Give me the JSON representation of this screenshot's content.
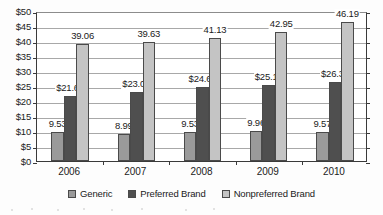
{
  "chart_data": {
    "type": "bar",
    "title": "",
    "xlabel": "",
    "ylabel": "",
    "categories": [
      "2006",
      "2007",
      "2008",
      "2009",
      "2010"
    ],
    "series": [
      {
        "name": "Generic",
        "color": "#9a9a9a",
        "values": [
          9.53,
          8.99,
          9.53,
          9.96,
          9.57
        ],
        "labels": [
          "9.53",
          "8.99",
          "9.53",
          "9.96",
          "9.57"
        ]
      },
      {
        "name": "Preferred Brand",
        "color": "#4f4f4f",
        "values": [
          21.61,
          23.08,
          24.62,
          25.19,
          26.31
        ],
        "labels": [
          "$21.61",
          "$23.08",
          "$24.62",
          "$25.19",
          "$26.31"
        ]
      },
      {
        "name": "Nonpreferred Brand",
        "color": "#c4c4c4",
        "values": [
          39.06,
          39.63,
          41.13,
          42.95,
          46.19
        ],
        "labels": [
          "39.06",
          "39.63",
          "41.13",
          "42.95",
          "46.19"
        ]
      }
    ],
    "ylim": [
      0,
      50
    ],
    "ytick_values": [
      0,
      5,
      10,
      15,
      20,
      25,
      30,
      35,
      40,
      45,
      50
    ],
    "ytick_labels": [
      "$0",
      "$5",
      "$10",
      "$15",
      "$20",
      "$25",
      "$30",
      "$35",
      "$40",
      "$45",
      "$50"
    ],
    "grid": true,
    "legend_position": "bottom"
  },
  "legend": {
    "items": [
      {
        "label": "Generic",
        "swatch": "legend-swatch-generic"
      },
      {
        "label": "Preferred Brand",
        "swatch": "legend-swatch-preferred-brand"
      },
      {
        "label": "Nonpreferred Brand",
        "swatch": "legend-swatch-nonpreferred-brand"
      }
    ]
  }
}
